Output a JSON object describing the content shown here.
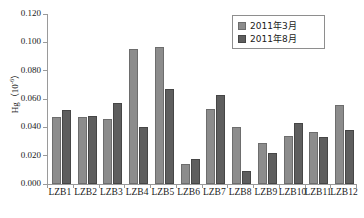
{
  "chart_data": {
    "type": "bar",
    "title": "",
    "xlabel": "",
    "ylabel": "Hg (10-6)",
    "ylabel_base": "Hg（10",
    "ylabel_exp": "-6",
    "ylabel_tail": "）",
    "ylim": [
      0.0,
      0.12
    ],
    "ytick_step": 0.02,
    "grid": false,
    "legend_position": "top-right",
    "categories": [
      "LZB1",
      "LZB2",
      "LZB3",
      "LZB4",
      "LZB5",
      "LZB6",
      "LZB7",
      "LZB8",
      "LZB9",
      "LZB10",
      "LZB11",
      "LZB12"
    ],
    "ytick_labels": [
      "0.120",
      "0.100",
      "0.080",
      "0.060",
      "0.040",
      "0.020",
      "0.000"
    ],
    "ytick_values": [
      0.12,
      0.1,
      0.08,
      0.06,
      0.04,
      0.02,
      0.0
    ],
    "series": [
      {
        "name": "2011年3月",
        "color": "#8c8c8c",
        "values": [
          0.047,
          0.047,
          0.046,
          0.095,
          0.097,
          0.014,
          0.053,
          0.04,
          0.029,
          0.034,
          0.037,
          0.056
        ]
      },
      {
        "name": "2011年8月",
        "color": "#5e5e5e",
        "values": [
          0.052,
          0.048,
          0.057,
          0.04,
          0.067,
          0.018,
          0.063,
          0.009,
          0.022,
          0.043,
          0.033,
          0.038
        ]
      }
    ]
  },
  "legend": {
    "items": [
      {
        "label": "2011年3月"
      },
      {
        "label": "2011年8月"
      }
    ]
  }
}
